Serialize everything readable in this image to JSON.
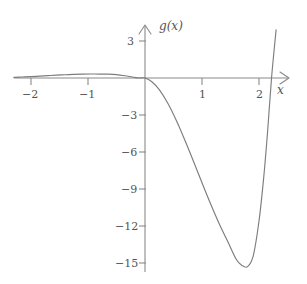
{
  "chart_data": {
    "type": "line",
    "title": "",
    "xlabel": "x",
    "ylabel": "g(x)",
    "xlim": [
      -2.3,
      2.35
    ],
    "ylim": [
      -16.5,
      4.2
    ],
    "grid": false,
    "legend": "none",
    "x_ticks": [
      -2,
      -1,
      1,
      2
    ],
    "x_tick_labels": [
      "−2",
      "−1",
      "1",
      "2"
    ],
    "y_ticks": [
      3,
      -3,
      -6,
      -9,
      -12,
      -15
    ],
    "y_tick_labels": [
      "3",
      "−3",
      "−6",
      "−9",
      "−12",
      "−15"
    ],
    "annotations": {
      "local_max": {
        "x": -0.55,
        "y": 0.3
      },
      "root_origin": {
        "x": 0,
        "y": 0
      },
      "local_min": {
        "x": 1.63,
        "y": -15.3
      },
      "root_right": {
        "x": 2.12,
        "y": 0
      }
    },
    "series": [
      {
        "name": "g(x)",
        "color": "#7d7d7d",
        "x": [
          -2.3,
          -2.15,
          -2.0,
          -1.85,
          -1.7,
          -1.55,
          -1.4,
          -1.25,
          -1.1,
          -0.95,
          -0.8,
          -0.65,
          -0.5,
          -0.35,
          -0.22,
          -0.1,
          0.0,
          0.12,
          0.25,
          0.4,
          0.55,
          0.7,
          0.85,
          1.0,
          1.15,
          1.3,
          1.45,
          1.6,
          1.7,
          1.8,
          1.9,
          2.0,
          2.08,
          2.15,
          2.22,
          2.3
        ],
        "y": [
          0.05,
          0.08,
          0.11,
          0.15,
          0.19,
          0.23,
          0.26,
          0.29,
          0.31,
          0.32,
          0.32,
          0.31,
          0.27,
          0.18,
          0.08,
          0.0,
          0.0,
          -0.3,
          -0.95,
          -2.05,
          -3.45,
          -5.05,
          -6.75,
          -8.5,
          -10.2,
          -11.8,
          -13.25,
          -14.7,
          -15.2,
          -15.3,
          -14.4,
          -11.6,
          -8.2,
          -4.4,
          0.0,
          3.9
        ]
      }
    ]
  },
  "axes": {
    "x_axis_name": "x",
    "y_axis_name": "g(x)",
    "x_tick_labels": [
      "−2",
      "−1",
      "1",
      "2"
    ],
    "y_tick_labels": [
      "3",
      "−3",
      "−6",
      "−9",
      "−12",
      "−15"
    ]
  },
  "colors": {
    "curve": "#7d7d7d",
    "axis": "#8a8a8a",
    "label": "#555555",
    "background": "#ffffff"
  }
}
